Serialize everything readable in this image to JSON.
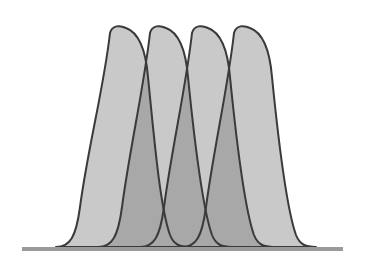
{
  "figure": {
    "colors": {
      "background": "#ffffff",
      "fill": "#c9c9c9",
      "overlap_fill": "#a8a8a8",
      "outline": "#3a3a3a",
      "baseline": "#9a9a9a"
    },
    "baseline": {
      "x1": 22,
      "x2": 343,
      "y": 249,
      "thickness": 4
    },
    "peaks": [
      {
        "id": "peak-1",
        "left_base": 62,
        "top_x": 118,
        "top_y": 27,
        "right_base": 182
      },
      {
        "id": "peak-2",
        "left_base": 104,
        "top_x": 158,
        "top_y": 27,
        "right_base": 224
      },
      {
        "id": "peak-3",
        "left_base": 146,
        "top_x": 200,
        "top_y": 27,
        "right_base": 266
      },
      {
        "id": "peak-4",
        "left_base": 188,
        "top_x": 242,
        "top_y": 27,
        "right_base": 308
      }
    ]
  }
}
